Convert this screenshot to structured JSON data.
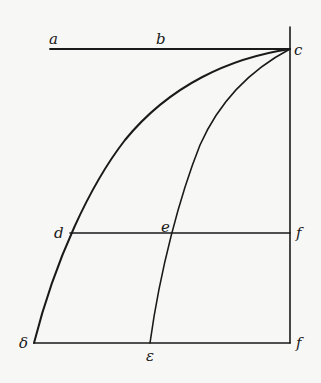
{
  "diagram": {
    "labels": {
      "a": "a",
      "b": "b",
      "c": "c",
      "d": "d",
      "e": "e",
      "f_upper": "f",
      "delta": "δ",
      "epsilon": "ε",
      "f_lower": "f"
    },
    "colors": {
      "ink": "#1a1a1a",
      "paper": "#f7f7f5"
    }
  }
}
